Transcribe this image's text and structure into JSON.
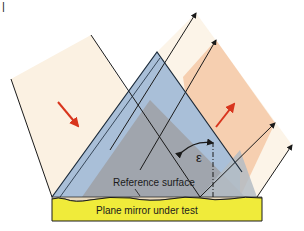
{
  "figure": {
    "panel_mark": "|",
    "labels": {
      "reference_surface": "Reference surface",
      "mirror": "Plane mirror under test",
      "angle": "ε"
    },
    "colors": {
      "incident_beam": "#fbf1e2",
      "reflected_beam_test": "#f6cfb0",
      "reflected_beam_ref": "#fcf4e8",
      "reference_flat": "#a9bfd8",
      "overlap": "#9ea2a8",
      "mirror": "#f0eb3a",
      "arrow": "#d8351d"
    },
    "arrows": [
      {
        "name": "incident-direction",
        "direction": "down-right"
      },
      {
        "name": "reflected-direction",
        "direction": "up-right"
      }
    ]
  }
}
